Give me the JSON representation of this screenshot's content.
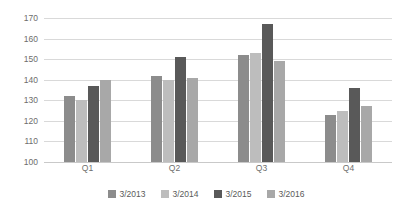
{
  "chart_data": {
    "type": "bar",
    "title": "",
    "xlabel": "",
    "ylabel": "",
    "categories": [
      "Q1",
      "Q2",
      "Q3",
      "Q4"
    ],
    "ylim": [
      100,
      170
    ],
    "yticks": [
      100,
      110,
      120,
      130,
      140,
      150,
      160,
      170
    ],
    "grid": true,
    "legend_position": "bottom",
    "series": [
      {
        "name": "3/2013",
        "color": "#8c8c8c",
        "values": [
          132,
          142,
          152,
          123
        ]
      },
      {
        "name": "3/2014",
        "color": "#bdbdbd",
        "values": [
          130,
          140,
          153,
          125
        ]
      },
      {
        "name": "3/2015",
        "color": "#595959",
        "values": [
          137,
          151,
          167,
          136
        ]
      },
      {
        "name": "3/2016",
        "color": "#a8a8a8",
        "values": [
          140,
          141,
          149,
          127
        ]
      }
    ]
  },
  "colors": {
    "gridline": "#d9d9d9",
    "tick_text": "#6d6d6d",
    "legend_text": "#5a5a5a",
    "background": "#ffffff"
  }
}
